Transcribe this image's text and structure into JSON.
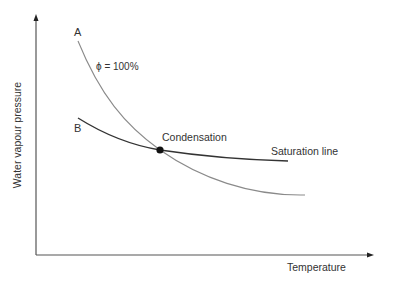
{
  "diagram": {
    "axes": {
      "x_label": "Temperature",
      "y_label": "Water vapour pressure"
    },
    "curves": [
      {
        "id": "A",
        "label": "A",
        "annotation": "ϕ = 100%",
        "color": "#8a8a8a"
      },
      {
        "id": "B",
        "label": "B",
        "annotation": "Saturation line",
        "color": "#333333"
      }
    ],
    "point": {
      "label": "Condensation",
      "color": "#111111"
    }
  }
}
